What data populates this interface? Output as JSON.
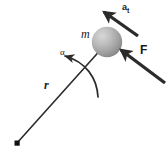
{
  "diagram": {
    "background_color": "#ffffff",
    "width": 167,
    "height": 155,
    "line_color": "#2b2b2b",
    "labels": {
      "mass": "m",
      "radius": "r",
      "angular_acceleration": "α",
      "force": "F",
      "tangential_acceleration_base": "a",
      "tangential_acceleration_subscript": "t"
    },
    "elements": {
      "sphere": {
        "name": "mass-sphere",
        "center_x": 107,
        "center_y": 42,
        "radius": 15,
        "fill_light": "#cfcfcf",
        "fill_mid": "#a8a8a8",
        "fill_dark": "#7f7f7f"
      },
      "pivot": {
        "name": "pivot-point",
        "x": 17,
        "y": 143,
        "size": 5,
        "color": "#111111"
      },
      "radius_line": {
        "name": "radius-line",
        "x1": 17,
        "y1": 143,
        "x2": 104,
        "y2": 46,
        "stroke_width": 1.6
      },
      "force_arrow": {
        "name": "force-arrow",
        "x1": 164,
        "y1": 82,
        "x2": 120,
        "y2": 49,
        "stroke_width": 3.2
      },
      "tangential_arrow": {
        "name": "tangential-acceleration-arrow",
        "x1": 137,
        "y1": 35,
        "x2": 103,
        "y2": 11,
        "stroke_width": 3.2
      },
      "alpha_arc": {
        "name": "angular-acceleration-arc",
        "start_x": 98,
        "start_y": 96,
        "ctrl_x": 93,
        "ctrl_y": 62,
        "end_x": 63,
        "end_y": 56,
        "stroke_width": 1.6
      }
    }
  }
}
